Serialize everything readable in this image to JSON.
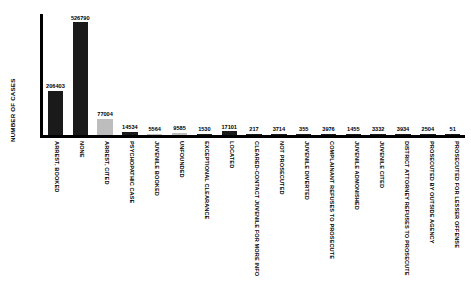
{
  "chart_data": {
    "type": "bar",
    "title": "",
    "xlabel": "",
    "ylabel": "NUMBER OF CASES",
    "ylim": [
      0,
      526790
    ],
    "grid": false,
    "legend": null,
    "categories": [
      "ARREST, BOOKED",
      "NONE",
      "ARREST, CITED",
      "PSYCHOPATHIC CASE",
      "JUVENILE BOOKED",
      "UNFOUNDED",
      "EXCEPTIONAL CLEARANCE",
      "LOCATED",
      "CLEARED-CONTACT JUVENILE FOR MORE INFO",
      "NOT PROSECUTED",
      "JUVENILE DIVERTED",
      "COMPLAINANT REFUSES TO PROSECUTE",
      "JUVENILE ADMONISHED",
      "JUVENILE CITED",
      "DISTRICT ATTORNEY REFUSES TO PROSECUTE",
      "PROSECUTED BY OUTSIDE AGENCY",
      "PROSECUTED FOR LESSER OFFENSE"
    ],
    "values": [
      206403,
      526790,
      77004,
      14534,
      5564,
      9585,
      1530,
      17101,
      217,
      3714,
      355,
      3976,
      1455,
      3332,
      3934,
      2504,
      51
    ],
    "value_labels": [
      "206403",
      "526790",
      "77004",
      "14534",
      "5564",
      "9585",
      "1530",
      "17101",
      "217",
      "3714",
      "355",
      "3976",
      "1455",
      "3332",
      "3934",
      "2504",
      "51"
    ],
    "bar_colors": [
      "#1a1a1a",
      "#1a1a1a",
      "#bdbdbd",
      "#1a1a1a",
      "#bdbdbd",
      "#bdbdbd",
      "#1a1a1a",
      "#1a1a1a",
      "#1a1a1a",
      "#1a1a1a",
      "#1a1a1a",
      "#1a1a1a",
      "#1a1a1a",
      "#1a1a1a",
      "#1a1a1a",
      "#1a1a1a",
      "#1a1a1a"
    ],
    "colors": {
      "dark_bar": "#1a1a1a",
      "light_bar": "#bdbdbd",
      "axis": "#000000",
      "background": "#ffffff",
      "text": "#000000"
    }
  }
}
